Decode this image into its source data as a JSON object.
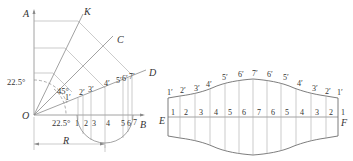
{
  "left_figure": {
    "points": {
      "A": "A",
      "K": "K",
      "C": "C",
      "D": "D",
      "O": "O",
      "B": "B",
      "R": "R"
    },
    "angles": {
      "angle_a": "22.5°",
      "angle_b": "45°",
      "angle_c": "22.5°"
    },
    "base_divisions": [
      "1",
      "2",
      "3",
      "4",
      "5",
      "6",
      "7"
    ],
    "projected_points": [
      "1′",
      "2′",
      "3′",
      "4′",
      "5′",
      "6′",
      "7′"
    ]
  },
  "right_figure": {
    "points": {
      "E": "E",
      "F": "F"
    },
    "center_numbers": [
      "1",
      "2",
      "3",
      "4",
      "5",
      "6",
      "7",
      "6",
      "5",
      "4",
      "3",
      "2",
      "1"
    ],
    "top_labels": [
      "1′",
      "2′",
      "3′",
      "4′",
      "5′",
      "6′",
      "7′",
      "6′",
      "5′",
      "4′",
      "3′",
      "2′",
      "1′"
    ]
  }
}
